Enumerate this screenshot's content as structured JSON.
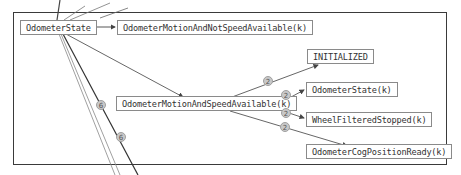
{
  "diagram": {
    "nodes": [
      {
        "id": "odometer-state",
        "label": "OdometerState"
      },
      {
        "id": "motion-not-speed",
        "label": "OdometerMotionAndNotSpeedAvailable(k)"
      },
      {
        "id": "motion-speed",
        "label": "OdometerMotionAndSpeedAvailable(k)"
      },
      {
        "id": "initialized",
        "label": "INITIALIZED"
      },
      {
        "id": "odometer-state-k",
        "label": "OdometerState(k)"
      },
      {
        "id": "wheel-filtered-stopped",
        "label": "WheelFilteredStopped(k)"
      },
      {
        "id": "cog-position-ready",
        "label": "OdometerCogPositionReady(k)"
      }
    ],
    "edges": [
      {
        "from": "odometer-state",
        "to": "motion-not-speed"
      },
      {
        "from": "odometer-state",
        "to": "motion-speed"
      },
      {
        "from": "motion-speed",
        "to": "initialized",
        "badge": "2"
      },
      {
        "from": "motion-speed",
        "to": "odometer-state-k",
        "badge": "2"
      },
      {
        "from": "motion-speed",
        "to": "wheel-filtered-stopped",
        "badge": "2"
      },
      {
        "from": "motion-speed",
        "to": "cog-position-ready",
        "badge": "2"
      }
    ],
    "side_badges": [
      "6",
      "6"
    ],
    "colors": {
      "frame": "#3a3a3a",
      "node_border": "#8a8a8a",
      "edge": "#555555",
      "badge_fill": "#c8c8c8"
    }
  }
}
